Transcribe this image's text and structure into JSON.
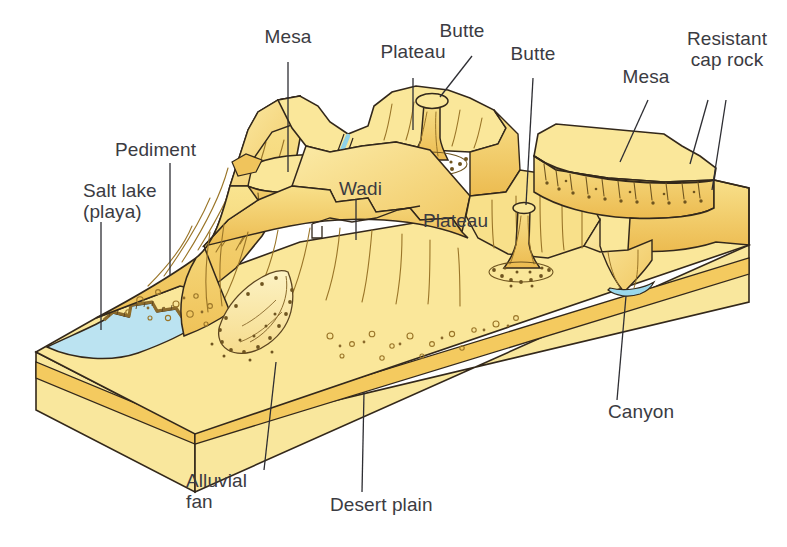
{
  "figure": {
    "type": "geological block diagram",
    "background_color": "#ffffff"
  },
  "colors": {
    "surface_light": "#fae79a",
    "surface_mid": "#f7d978",
    "surface_shadow": "#f0c45c",
    "surface_deep_shadow": "#e8b44b",
    "block_side_light": "#f8eaa4",
    "block_side_mid": "#f6dd86",
    "stratum_band": "#f5cf6a",
    "water_blue": "#b9e2f0",
    "water_blue_dark": "#8fd0e6",
    "outline": "#33281b",
    "label_text": "#3b3b42",
    "leader_line": "#2e2e33"
  },
  "labels": [
    {
      "id": "mesa-top",
      "text": "Mesa",
      "x": 288,
      "y": 35,
      "align": "center"
    },
    {
      "id": "plateau-top",
      "text": "Plateau",
      "x": 413,
      "y": 50,
      "align": "center"
    },
    {
      "id": "butte-top",
      "text": "Butte",
      "x": 462,
      "y": 29,
      "align": "center"
    },
    {
      "id": "butte-mid",
      "text": "Butte",
      "x": 532,
      "y": 52,
      "align": "center"
    },
    {
      "id": "mesa-right",
      "text": "Mesa",
      "x": 645,
      "y": 75,
      "align": "center"
    },
    {
      "id": "resistant-cap",
      "text": "Resistant\ncap rock",
      "x": 725,
      "y": 36,
      "align": "center"
    },
    {
      "id": "pediment",
      "text": "Pediment",
      "x": 119,
      "y": 148,
      "align": "left"
    },
    {
      "id": "salt-lake",
      "text": "Salt lake\n(playa)",
      "x": 86,
      "y": 189,
      "align": "left"
    },
    {
      "id": "wadi",
      "text": "Wadi",
      "x": 348,
      "y": 186,
      "align": "left"
    },
    {
      "id": "plateau-mid",
      "text": "Plateau",
      "x": 427,
      "y": 218,
      "align": "left"
    },
    {
      "id": "canyon",
      "text": "Canyon",
      "x": 610,
      "y": 409,
      "align": "left"
    },
    {
      "id": "alluvial-fan",
      "text": "Alluvial\nfan",
      "x": 188,
      "y": 478,
      "align": "left"
    },
    {
      "id": "desert-plain",
      "text": "Desert plain",
      "x": 332,
      "y": 502,
      "align": "left"
    }
  ],
  "leader_lines": [
    {
      "id": "mesa-top-leader",
      "points": "288,62 288,172"
    },
    {
      "id": "plateau-top-leader",
      "points": "413,78 413,136"
    },
    {
      "id": "butte-top-leader",
      "points": "470,56 438,96"
    },
    {
      "id": "butte-mid-leader",
      "points": "532,78 526,208"
    },
    {
      "id": "mesa-right-leader",
      "points": "645,100 617,160"
    },
    {
      "id": "cap-rock-leader-a",
      "points": "707,75 687,160"
    },
    {
      "id": "cap-rock-leader-b",
      "points": "731,75 713,190"
    },
    {
      "id": "pediment-leader",
      "points": "170,163 170,274"
    },
    {
      "id": "salt-lake-leader",
      "points": "101,222 101,330"
    },
    {
      "id": "wadi-leader",
      "points": "356,198 356,238"
    },
    {
      "id": "canyon-leader",
      "points": "618,400 625,298"
    },
    {
      "id": "alluvial-fan-leader",
      "points": "267,468 276,368"
    },
    {
      "id": "desert-plain-leader",
      "points": "360,492 363,392"
    }
  ],
  "features": [
    {
      "name": "mesa",
      "description": "flat-topped hill with resistant cap rock, steep sides"
    },
    {
      "name": "plateau",
      "description": "broad elevated flat upland surface"
    },
    {
      "name": "butte",
      "description": "narrow isolated steep-sided tower of rock with resistant cap"
    },
    {
      "name": "resistant cap rock",
      "description": "hard rock layer protecting softer rock beneath"
    },
    {
      "name": "pediment",
      "description": "gently sloping bedrock surface at mountain base"
    },
    {
      "name": "salt lake (playa)",
      "description": "shallow ephemeral lake with salt crust rim"
    },
    {
      "name": "wadi",
      "description": "dry desert stream channel, intermittently flowing"
    },
    {
      "name": "canyon",
      "description": "deep steep-walled valley cut by a river"
    },
    {
      "name": "alluvial fan",
      "description": "fan-shaped deposit of sediment at canyon mouth"
    },
    {
      "name": "desert plain",
      "description": "low flat arid surface forming the block floor"
    }
  ]
}
